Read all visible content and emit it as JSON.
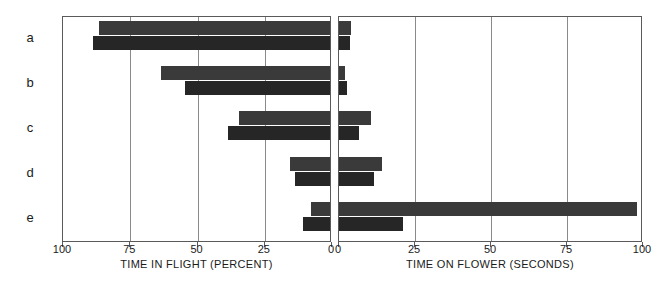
{
  "chart_data": {
    "type": "bar",
    "title": "",
    "orientation": "horizontal",
    "layout": "back-to-back bidirectional bar chart (two panels sharing category axis)",
    "categories": [
      "a",
      "b",
      "c",
      "d",
      "e"
    ],
    "grid": true,
    "legend_position": "none",
    "panels": [
      {
        "name": "left",
        "xlabel": "TIME IN FLIGHT (PERCENT)",
        "direction": "right-to-left",
        "xlim": [
          100,
          0
        ],
        "ticks": [
          100,
          75,
          50,
          25,
          0
        ],
        "tick_labels": [
          "100",
          "75",
          "50",
          "25",
          "0"
        ],
        "series": [
          {
            "name": "upper",
            "color": "#3a3a3a",
            "values": [
              86,
              63,
              34,
              15,
              7
            ]
          },
          {
            "name": "lower",
            "color": "#262626",
            "values": [
              88,
              54,
              38,
              13,
              10
            ]
          }
        ]
      },
      {
        "name": "right",
        "xlabel": "TIME ON FLOWER (SECONDS)",
        "direction": "left-to-right",
        "xlim": [
          0,
          100
        ],
        "ticks": [
          0,
          25,
          50,
          75,
          100
        ],
        "tick_labels": [
          "0",
          "25",
          "50",
          "75",
          "100"
        ],
        "series": [
          {
            "name": "upper",
            "color": "#3a3a3a",
            "values": [
              4,
              2,
              10.5,
              14,
              98
            ]
          },
          {
            "name": "lower",
            "color": "#262626",
            "values": [
              3.5,
              2.5,
              6.5,
              11.5,
              21
            ]
          }
        ]
      }
    ]
  },
  "colors": {
    "bar_upper": "#3a3a3a",
    "bar_lower": "#262626",
    "gridline": "#8a8a8a",
    "frame": "#5a5a5a",
    "background": "#ffffff",
    "text": "#1a1a1a"
  }
}
